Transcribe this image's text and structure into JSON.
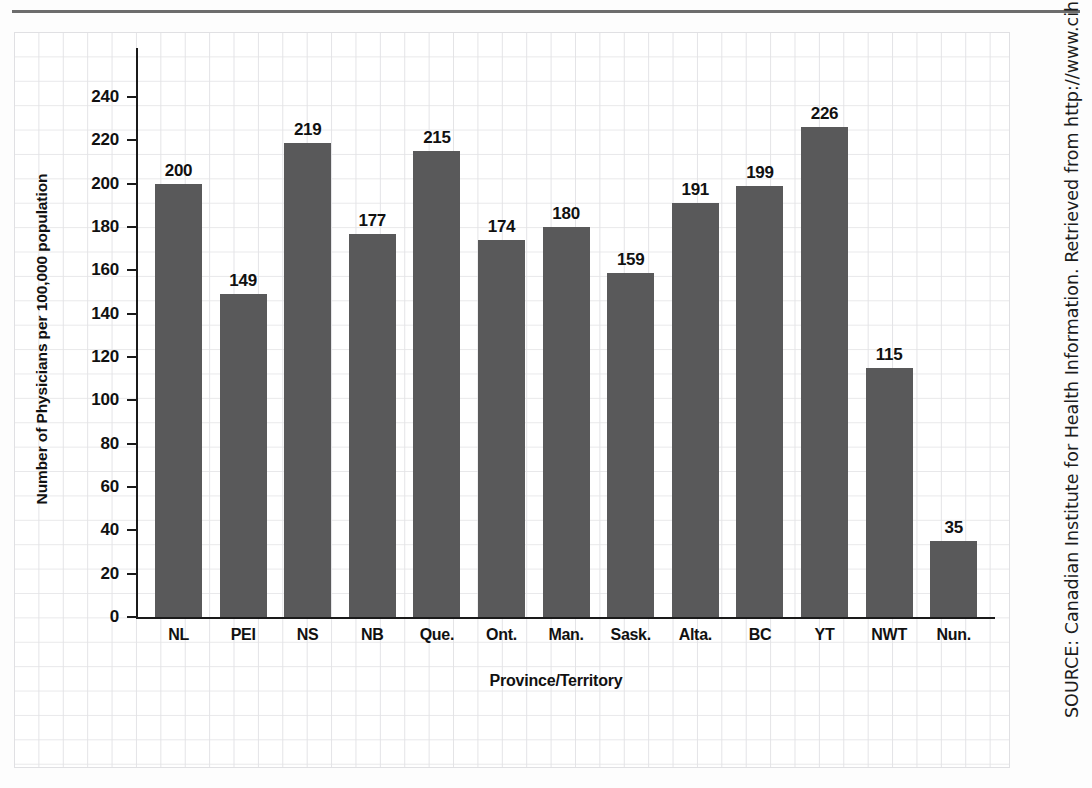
{
  "page": {
    "background_color": "#fdfdfd",
    "grid_color": "#e3e3e6",
    "rule_color": "#6d6d6d"
  },
  "source_note": "SOURCE: Canadian Institute for Health Information. Retrieved from http://www.cihi.ca",
  "chart_data": {
    "type": "bar",
    "title": "",
    "xlabel": "Province/Territory",
    "ylabel": "Number of Physicians per 100,000 population",
    "categories": [
      "NL",
      "PEI",
      "NS",
      "NB",
      "Que.",
      "Ont.",
      "Man.",
      "Sask.",
      "Alta.",
      "BC",
      "YT",
      "NWT",
      "Nun."
    ],
    "values": [
      200,
      149,
      219,
      177,
      215,
      174,
      180,
      159,
      191,
      199,
      226,
      115,
      35
    ],
    "value_labels": [
      "200",
      "149",
      "219",
      "177",
      "215",
      "174",
      "180",
      "159",
      "191",
      "199",
      "226",
      "115",
      "35"
    ],
    "ylim": [
      0,
      250
    ],
    "yticks": [
      0,
      20,
      40,
      60,
      80,
      100,
      120,
      140,
      160,
      180,
      200,
      220,
      240
    ],
    "ytick_labels": [
      "0",
      "20",
      "40",
      "60",
      "80",
      "100",
      "120",
      "140",
      "160",
      "180",
      "200",
      "220",
      "240"
    ],
    "grid": true,
    "legend": false,
    "bar_color": "#59595a",
    "axis_color": "#1a1a1a",
    "label_color": "#111111"
  }
}
